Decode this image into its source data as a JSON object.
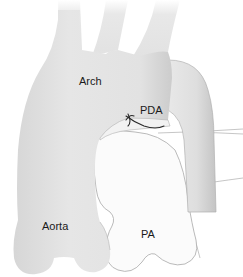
{
  "diagram": {
    "type": "anatomical-illustration",
    "labels": {
      "arch": "Arch",
      "pda": "PDA",
      "aorta": "Aorta",
      "pa": "PA"
    },
    "colors": {
      "aorta_fill": "#e4e4e4",
      "aorta_shade": "#cfcfcf",
      "pa_fill": "#fafafa",
      "outline": "#a8a8a8",
      "ligature": "#2a2a2a",
      "background": "#ffffff"
    },
    "structures": [
      {
        "id": "aorta",
        "label": "Aorta",
        "description": "ascending aorta and arch, gray"
      },
      {
        "id": "arch-branches",
        "label": "",
        "description": "three head-and-neck branch vessels"
      },
      {
        "id": "descending-aorta",
        "label": "",
        "description": "descending aorta on right side"
      },
      {
        "id": "pa",
        "label": "PA",
        "description": "pulmonary artery, white"
      },
      {
        "id": "pda",
        "label": "PDA",
        "description": "ductus with ligature suture"
      }
    ]
  }
}
